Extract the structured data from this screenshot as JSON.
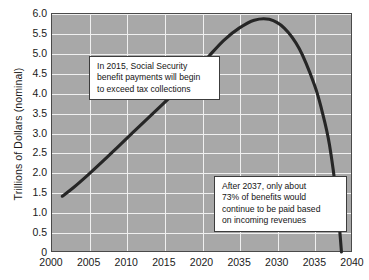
{
  "chart_data": {
    "type": "line",
    "title": "",
    "xlabel": "",
    "ylabel": "Trillions of Dollars (nominal)",
    "xlim": [
      2000,
      2040
    ],
    "ylim": [
      0,
      6.0
    ],
    "grid": true,
    "legend": null,
    "x_ticks": [
      "2000",
      "2005",
      "2010",
      "2015",
      "2020",
      "2035",
      "2030",
      "2035",
      "2040"
    ],
    "x_tick_values": [
      2000,
      2005,
      2010,
      2015,
      2020,
      2025,
      2030,
      2035,
      2040
    ],
    "y_ticks": [
      "0",
      "0.5",
      "1.0",
      "1.5",
      "2.0",
      "2.5",
      "3.0",
      "3.5",
      "4.0",
      "4.5",
      "5.0",
      "5.5",
      "6.0"
    ],
    "y_tick_values": [
      0,
      0.5,
      1.0,
      1.5,
      2.0,
      2.5,
      3.0,
      3.5,
      4.0,
      4.5,
      5.0,
      5.5,
      6.0
    ],
    "series": [
      {
        "name": "Social Security trust fund balance",
        "x": [
          2001.5,
          2003,
          2005,
          2007,
          2009,
          2011,
          2013,
          2015,
          2017,
          2019,
          2021,
          2023,
          2025,
          2027,
          2029,
          2031,
          2033,
          2035,
          2036,
          2037,
          2038,
          2038.6
        ],
        "values": [
          1.4,
          1.62,
          1.95,
          2.3,
          2.66,
          3.02,
          3.38,
          3.74,
          4.1,
          4.5,
          4.92,
          5.32,
          5.62,
          5.82,
          5.84,
          5.62,
          5.1,
          4.2,
          3.55,
          2.7,
          1.3,
          0.0
        ]
      }
    ],
    "annotations": [
      {
        "id": "annotation-1",
        "text": "In 2015, Social Security\nbenefit payments will begin\nto exceed tax collections"
      },
      {
        "id": "annotation-2",
        "text": "After 2037, only about\n73% of benefits would\ncontinue to be paid based\non incoming revenues"
      }
    ],
    "colors": {
      "plot_background": "#a8a8a8",
      "gridline": "#f0f0f0",
      "curve": "#262626",
      "axis_border": "#4a4a4a",
      "annotation_background": "#ffffff",
      "annotation_border": "#3c3c3c",
      "text": "#141414",
      "page_background": "#ffffff"
    }
  }
}
